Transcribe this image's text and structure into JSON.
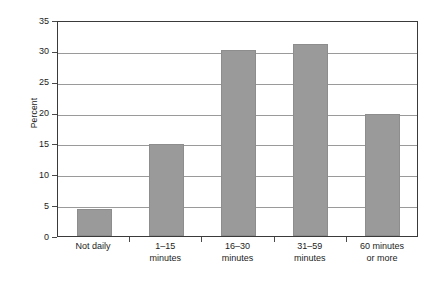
{
  "chart_data": {
    "type": "bar",
    "title": "",
    "xlabel": "",
    "ylabel": "Percent",
    "categories": [
      "Not daily",
      "1–15 minutes",
      "16–30 minutes",
      "31–59 minutes",
      "60 minutes or more"
    ],
    "category_lines": [
      [
        "Not daily"
      ],
      [
        "1–15",
        "minutes"
      ],
      [
        "16–30",
        "minutes"
      ],
      [
        "31–59",
        "minutes"
      ],
      [
        "60 minutes",
        "or more"
      ]
    ],
    "values": [
      4.3,
      14.9,
      30.2,
      31.1,
      19.7
    ],
    "ylim": [
      0,
      35
    ],
    "ytick_step": 5,
    "yticks": [
      0,
      5,
      10,
      15,
      20,
      25,
      30,
      35
    ],
    "grid": true,
    "legend": "none",
    "bar_color": "#9a9a9a",
    "gridline_color": "#9a9a9a",
    "axis_color": "#3a3a3a",
    "background_color": "#ffffff"
  }
}
